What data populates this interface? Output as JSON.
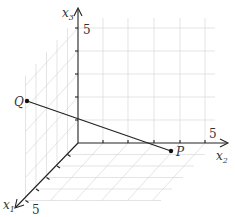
{
  "diagram": {
    "type": "3d-coordinate-system",
    "axes": [
      {
        "name": "x1",
        "label": "x",
        "subscript": "1",
        "tick_label": "5",
        "ticks": 5
      },
      {
        "name": "x2",
        "label": "x",
        "subscript": "2",
        "tick_label": "5",
        "ticks": 5
      },
      {
        "name": "x3",
        "label": "x",
        "subscript": "3",
        "tick_label": "5",
        "ticks": 5
      }
    ],
    "points": [
      {
        "name": "Q",
        "label": "Q"
      },
      {
        "name": "P",
        "label": "P"
      }
    ],
    "segment": {
      "from": "Q",
      "to": "P"
    },
    "colors": {
      "axis": "#222222",
      "grid": "#d8d8d8",
      "segment": "#222222",
      "point": "#111111"
    }
  }
}
